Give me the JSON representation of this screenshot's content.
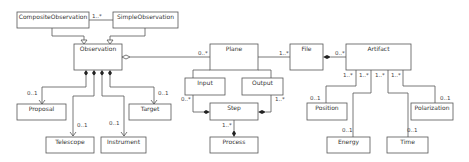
{
  "diagram": {
    "type": "uml-class",
    "classes": {
      "composite_observation": "CompositeObservation",
      "simple_observation": "SimpleObservation",
      "observation": "Observation",
      "proposal": "Proposal",
      "telescope": "Telescope",
      "instrument": "Instrument",
      "target": "Target",
      "plane": "Plane",
      "input": "Input",
      "output": "Output",
      "step": "Step",
      "process": "Process",
      "file": "File",
      "artifact": "Artifact",
      "position": "Position",
      "energy": "Energy",
      "time": "Time",
      "polarization": "Polarization"
    },
    "multiplicities": {
      "composite_simple": "1..*",
      "obs_proposal": "0..1",
      "obs_telescope": "0..1",
      "obs_instrument": "0..1",
      "obs_target": "0..1",
      "obs_plane": "0..*",
      "plane_file": "1..*",
      "file_artifact": "0..*",
      "input_step": "0..*",
      "output_step": "1..*",
      "step_process": "1..*",
      "artifact_position_src": "1..*",
      "artifact_energy_src": "1..*",
      "artifact_time_src": "1..*",
      "artifact_polarization_src": "1..*",
      "position": "0..1",
      "energy": "0..1",
      "time": "0..1",
      "polarization": "0..1"
    },
    "colors": {
      "stroke": "#555555",
      "fill": "#ffffff",
      "text": "#333333"
    }
  }
}
